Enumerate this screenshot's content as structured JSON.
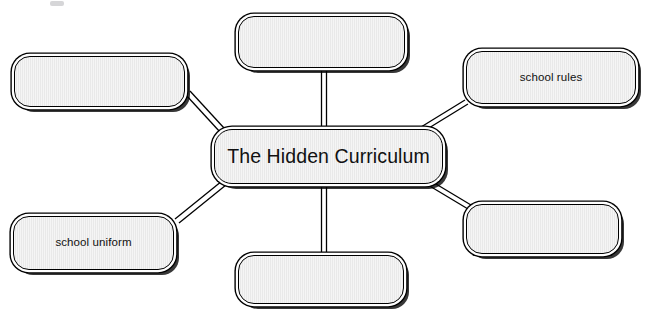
{
  "diagram": {
    "type": "mind-map",
    "canvas": {
      "width": 646,
      "height": 321,
      "background": "#ffffff"
    },
    "style": {
      "node_fill": "#e9e9e9",
      "node_border": "#000000",
      "connector_color": "#000000",
      "text_color": "#111111",
      "shadow_color": "#000000"
    },
    "central_node": {
      "id": "central",
      "label": "The Hidden Curriculum",
      "x": 214,
      "y": 129,
      "width": 229,
      "height": 55
    },
    "satellite_nodes": [
      {
        "id": "top-left",
        "label": "",
        "empty": true,
        "x": 14,
        "y": 56,
        "width": 171,
        "height": 51
      },
      {
        "id": "top-center",
        "label": "",
        "empty": true,
        "x": 238,
        "y": 16,
        "width": 167,
        "height": 52
      },
      {
        "id": "top-right",
        "label": "school rules",
        "empty": false,
        "x": 466,
        "y": 51,
        "width": 170,
        "height": 53
      },
      {
        "id": "bottom-left",
        "label": "school uniform",
        "empty": false,
        "x": 13,
        "y": 216,
        "width": 161,
        "height": 54
      },
      {
        "id": "bottom-center",
        "label": "",
        "empty": true,
        "x": 238,
        "y": 255,
        "width": 166,
        "height": 49
      },
      {
        "id": "bottom-right",
        "label": "",
        "empty": true,
        "x": 466,
        "y": 204,
        "width": 153,
        "height": 50
      }
    ],
    "connectors": [
      {
        "id": "central-to-top-left",
        "from": "central",
        "to": "top-left"
      },
      {
        "id": "central-to-top-center",
        "from": "central",
        "to": "top-center"
      },
      {
        "id": "central-to-top-right",
        "from": "central",
        "to": "top-right"
      },
      {
        "id": "central-to-bottom-left",
        "from": "central",
        "to": "bottom-left"
      },
      {
        "id": "central-to-bottom-center",
        "from": "central",
        "to": "bottom-center"
      },
      {
        "id": "central-to-bottom-right",
        "from": "central",
        "to": "bottom-right"
      }
    ]
  }
}
